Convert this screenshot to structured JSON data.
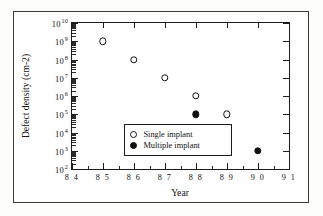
{
  "figure": {
    "background_color": "#fdfdfb",
    "frame_color": "#3a3a3a",
    "axis_color": "#1c1c1c"
  },
  "chart_data": {
    "type": "scatter",
    "title": "",
    "xlabel": "Year",
    "ylabel": "Defect density (cm-2)",
    "xlim": [
      84,
      91
    ],
    "ylim": [
      2,
      10
    ],
    "y_scale": "log10",
    "grid": false,
    "legend_position": "lower-left-inside",
    "x_ticks": [
      "8 4",
      "8 5",
      "8 6",
      "8 7",
      "8 8",
      "8 9",
      "9 0",
      "9 1"
    ],
    "x_tick_values": [
      84,
      85,
      86,
      87,
      88,
      89,
      90,
      91
    ],
    "y_ticks": [
      {
        "mantissa": "10",
        "exponent": "10",
        "value": 10
      },
      {
        "mantissa": "10",
        "exponent": "9",
        "value": 9
      },
      {
        "mantissa": "10",
        "exponent": "8",
        "value": 8
      },
      {
        "mantissa": "10",
        "exponent": "7",
        "value": 7
      },
      {
        "mantissa": "10",
        "exponent": "6",
        "value": 6
      },
      {
        "mantissa": "10",
        "exponent": "5",
        "value": 5
      },
      {
        "mantissa": "10",
        "exponent": "4",
        "value": 4
      },
      {
        "mantissa": "10",
        "exponent": "3",
        "value": 3
      },
      {
        "mantissa": "10",
        "exponent": "2",
        "value": 2
      }
    ],
    "series": [
      {
        "name": "Single implant",
        "marker": "open-circle",
        "color": "#111111",
        "x": [
          85,
          86,
          87,
          88,
          89
        ],
        "y_exponent": [
          9,
          8,
          7,
          6,
          5
        ]
      },
      {
        "name": "Multiple implant",
        "marker": "filled-circle",
        "color": "#111111",
        "x": [
          88,
          89,
          90
        ],
        "y_exponent": [
          5,
          4,
          3
        ]
      }
    ]
  },
  "legend": {
    "entries": [
      {
        "label": "Single implant",
        "marker": "open-circle"
      },
      {
        "label": "Multiple implant",
        "marker": "filled-circle"
      }
    ]
  }
}
